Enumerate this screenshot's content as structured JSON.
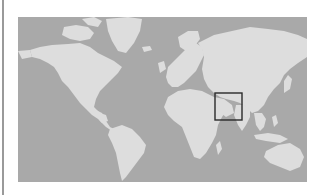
{
  "map": {
    "type": "world-map",
    "projection": "mercator",
    "colors": {
      "ocean": "#a9a9a9",
      "land": "#dddddd",
      "highlight_box": "#2a2a2a",
      "background": "#ffffff",
      "left_rule": "#9a9a9a"
    },
    "highlight": {
      "region": "South Asia / Indian subcontinent",
      "shape": "rectangle"
    }
  }
}
